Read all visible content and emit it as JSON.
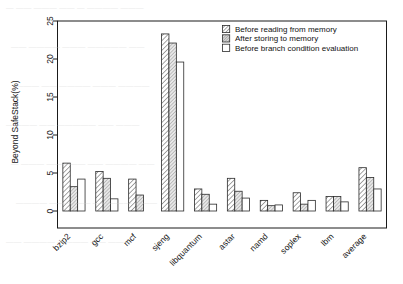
{
  "chart_data": {
    "type": "bar",
    "title": "",
    "xlabel": "",
    "ylabel": "Beyond SafeStack(%)",
    "ylim": [
      0,
      25
    ],
    "yticks": [
      0,
      5,
      10,
      15,
      20,
      25
    ],
    "ytick_labels": [
      "0",
      "5",
      "10",
      "15",
      "20",
      "25"
    ],
    "grid": false,
    "legend_position": "top-right",
    "categories": [
      "bzip2",
      "gcc",
      "mcf",
      "sjeng",
      "libquantum",
      "astar",
      "namd",
      "soplex",
      "lbm",
      "average"
    ],
    "series": [
      {
        "name": "Before reading from memory",
        "pattern": "diagonal-hatch-forward",
        "values": [
          6.3,
          5.2,
          4.2,
          23.3,
          2.9,
          4.3,
          1.4,
          2.4,
          1.9,
          5.7
        ]
      },
      {
        "name": "After storing to memory",
        "pattern": "diagonal-hatch-dense-grey",
        "values": [
          3.2,
          4.3,
          2.1,
          22.1,
          2.2,
          2.6,
          0.7,
          0.9,
          1.9,
          4.4
        ]
      },
      {
        "name": "Before branch condition evaluation",
        "pattern": "solid-white",
        "values": [
          4.2,
          1.6,
          0.0,
          19.6,
          0.9,
          1.7,
          0.8,
          1.4,
          1.2,
          2.9
        ]
      }
    ],
    "colors": {
      "outline": "#2b2b2b",
      "series1_fill": "#ffffff",
      "series2_fill": "#e6e6e6",
      "series3_fill": "#ffffff",
      "text": "#151515",
      "background": "#ffffff"
    }
  },
  "legend": {
    "items": [
      {
        "label": "Before reading from memory",
        "swatch": "hatch-forward-swatch"
      },
      {
        "label": "After storing to memory",
        "swatch": "hatch-dense-swatch"
      },
      {
        "label": "Before branch condition evaluation",
        "swatch": "plain-swatch"
      }
    ]
  },
  "axes": {
    "y_title": "Beyond SafeStack(%)"
  },
  "page_bleed": {
    "rows": [
      "— —— ———  ——  — ————  ———",
      "——  ———— ———  ————— ——",
      "——— —— ———— ———  ————",
      "————  ——  —————  ——  ———",
      "— ——— ————— —— ———— ——",
      "———— ——— —— ————— ———",
      "—— ———— ———— —— ———"
    ]
  }
}
